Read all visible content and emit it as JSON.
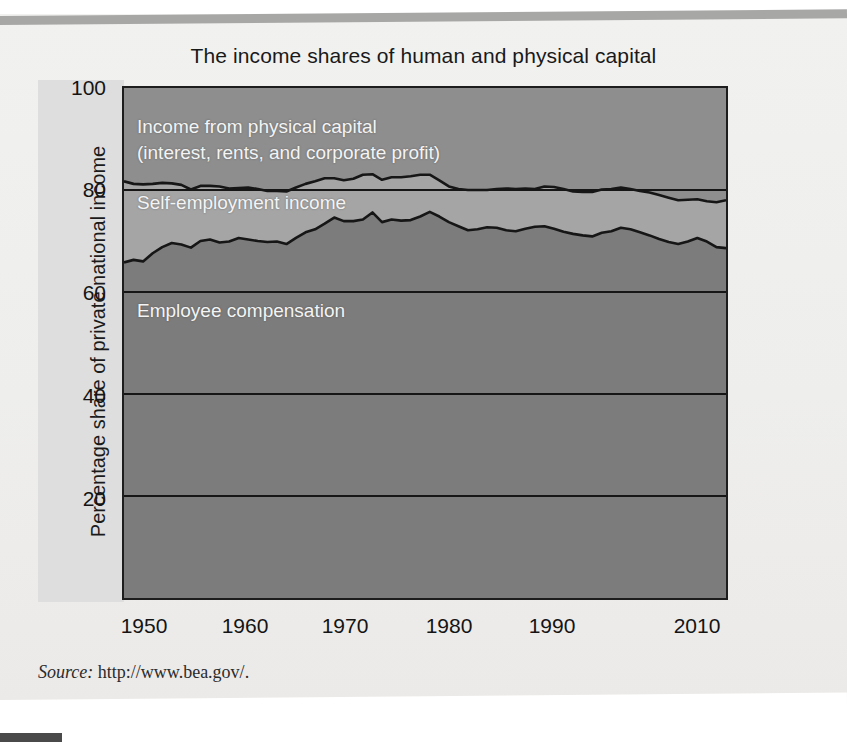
{
  "figure": {
    "title": "The income shares of human and physical capital",
    "source_label": "Source:",
    "source_url": "http://www.bea.gov/."
  },
  "axes": {
    "ylabel": "Percentage share of private national income",
    "yticks": [
      "100",
      "80",
      "60",
      "40",
      "20"
    ],
    "xticks": [
      "1950",
      "1960",
      "1970",
      "1980",
      "1990",
      "2010"
    ]
  },
  "bands": {
    "physical": "Income from physical capital",
    "physical_detail": "(interest, rents, and corporate profit)",
    "self_employment": "Self-employment income",
    "employee": "Employee compensation"
  },
  "colors": {
    "physical_capital": "#8e8e8e",
    "self_employment": "#a5a5a5",
    "employee_compensation": "#7c7c7c",
    "line": "#161616",
    "page": "#eeeeec",
    "axis_strip": "#dedede"
  },
  "chart_data": {
    "type": "area",
    "title": "The income shares of human and physical capital",
    "xlabel": "",
    "ylabel": "Percentage share of private national income",
    "xlim": [
      1948,
      2011
    ],
    "ylim": [
      0,
      100
    ],
    "grid": true,
    "stacked": true,
    "legend": "inline-labels",
    "x": [
      1948,
      1949,
      1950,
      1951,
      1952,
      1953,
      1954,
      1955,
      1956,
      1957,
      1958,
      1959,
      1960,
      1961,
      1962,
      1963,
      1964,
      1965,
      1966,
      1967,
      1968,
      1969,
      1970,
      1971,
      1972,
      1973,
      1974,
      1975,
      1976,
      1977,
      1978,
      1979,
      1980,
      1981,
      1982,
      1983,
      1984,
      1985,
      1986,
      1987,
      1988,
      1989,
      1990,
      1991,
      1992,
      1993,
      1994,
      1995,
      1996,
      1997,
      1998,
      1999,
      2000,
      2001,
      2002,
      2003,
      2004,
      2005,
      2006,
      2007,
      2008,
      2009,
      2010,
      2011
    ],
    "series": [
      {
        "name": "Employee compensation",
        "values": [
          65.8,
          66.3,
          66.0,
          67.6,
          68.8,
          69.6,
          69.3,
          68.7,
          70.0,
          70.3,
          69.7,
          69.9,
          70.6,
          70.3,
          70.0,
          69.8,
          69.9,
          69.4,
          70.6,
          71.7,
          72.3,
          73.4,
          74.6,
          73.9,
          73.9,
          74.2,
          75.6,
          73.7,
          74.2,
          74.0,
          74.1,
          74.8,
          75.7,
          74.8,
          73.7,
          72.9,
          72.1,
          72.3,
          72.7,
          72.6,
          72.1,
          71.9,
          72.4,
          72.8,
          72.9,
          72.4,
          71.8,
          71.4,
          71.1,
          70.9,
          71.6,
          71.9,
          72.6,
          72.3,
          71.7,
          71.1,
          70.4,
          69.8,
          69.4,
          69.9,
          70.6,
          69.9,
          68.8,
          68.6
        ]
      },
      {
        "name": "Self-employment income",
        "values": [
          15.9,
          14.9,
          15.1,
          13.6,
          12.6,
          11.7,
          11.7,
          11.4,
          10.8,
          10.5,
          11.0,
          10.4,
          9.8,
          10.2,
          10.2,
          10.0,
          9.9,
          10.3,
          9.9,
          9.5,
          9.4,
          8.9,
          7.7,
          8.0,
          8.3,
          8.8,
          7.5,
          8.3,
          8.3,
          8.5,
          8.6,
          8.2,
          7.3,
          7.1,
          7.0,
          7.3,
          7.9,
          7.7,
          7.3,
          7.6,
          8.2,
          8.3,
          7.9,
          7.4,
          7.8,
          8.2,
          8.4,
          8.3,
          8.5,
          8.7,
          8.5,
          8.3,
          7.9,
          7.9,
          8.1,
          8.4,
          8.6,
          8.7,
          8.6,
          8.2,
          7.6,
          7.9,
          8.8,
          9.4
        ]
      },
      {
        "name": "Income from physical capital (interest, rents, and corporate profit)",
        "values": [
          18.3,
          18.8,
          18.9,
          18.8,
          18.6,
          18.7,
          19.0,
          19.9,
          19.2,
          19.2,
          19.3,
          19.7,
          19.6,
          19.5,
          19.8,
          20.2,
          20.2,
          20.3,
          19.5,
          18.8,
          18.3,
          17.7,
          17.7,
          18.1,
          17.8,
          17.0,
          16.9,
          18.0,
          17.5,
          17.5,
          17.3,
          17.0,
          17.0,
          18.1,
          19.3,
          19.8,
          20.0,
          20.0,
          20.0,
          19.8,
          19.7,
          19.8,
          19.7,
          19.8,
          19.3,
          19.4,
          19.8,
          20.3,
          20.4,
          20.4,
          19.9,
          19.8,
          19.5,
          19.8,
          20.2,
          20.5,
          21.0,
          21.5,
          22.0,
          21.9,
          21.8,
          22.2,
          22.4,
          22.0
        ]
      }
    ],
    "cumulative_upper_curve_note": "Upper black line = employee compensation + self-employment income (top of human-capital share), ranging roughly 78-83.",
    "cumulative_upper": [
      81.7,
      81.2,
      81.1,
      81.2,
      81.4,
      81.3,
      81.0,
      80.1,
      80.8,
      80.8,
      80.7,
      80.3,
      80.4,
      80.5,
      80.2,
      79.8,
      79.8,
      79.7,
      80.5,
      81.2,
      81.7,
      82.3,
      82.3,
      81.9,
      82.2,
      83.0,
      83.1,
      82.0,
      82.5,
      82.5,
      82.7,
      83.0,
      83.0,
      81.9,
      80.7,
      80.2,
      80.0,
      80.0,
      80.0,
      80.2,
      80.3,
      80.2,
      80.3,
      80.2,
      80.7,
      80.6,
      80.2,
      79.7,
      79.6,
      79.6,
      80.1,
      80.2,
      80.5,
      80.2,
      79.8,
      79.5,
      79.0,
      78.5,
      78.0,
      78.1,
      78.2,
      77.8,
      77.6,
      78.0
    ]
  }
}
